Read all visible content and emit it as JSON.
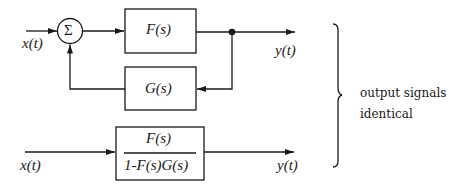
{
  "diagram": {
    "top": {
      "input_label": "x(t)",
      "sum_symbol": "Σ",
      "forward_block": "F(s)",
      "feedback_block": "G(s)",
      "output_label": "y(t)"
    },
    "bottom": {
      "input_label": "x(t)",
      "numerator": "F(s)",
      "denominator": "1-F(s)G(s)",
      "output_label": "y(t)"
    },
    "annotation": {
      "line1": "output signals",
      "line2": "identical"
    },
    "colors": {
      "stroke": "#1a1a1a",
      "background": "#ffffff"
    }
  }
}
